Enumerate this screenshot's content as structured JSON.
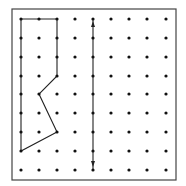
{
  "diagram": {
    "type": "dot-grid-geoboard",
    "grid": {
      "columns": 9,
      "rows": 9,
      "col_x": [
        21,
        39,
        57,
        75,
        93,
        111,
        129,
        147,
        166
      ],
      "row_y": [
        19,
        38,
        57,
        76,
        94,
        113,
        132,
        151,
        170
      ],
      "dot_color": "#111111",
      "dot_radius": 1.6
    },
    "frame": {
      "x": 12,
      "y": 9,
      "width": 164,
      "height": 171,
      "stroke": "#444444"
    },
    "polygon": {
      "vertices_grid": [
        [
          0,
          0
        ],
        [
          2,
          0
        ],
        [
          2,
          3
        ],
        [
          1,
          4
        ],
        [
          2,
          6
        ],
        [
          0,
          7
        ]
      ],
      "stroke": "#222222"
    },
    "arrow": {
      "column": 4,
      "from_row": 0,
      "to_row": 8,
      "double_headed": true,
      "stroke": "#222222"
    }
  }
}
